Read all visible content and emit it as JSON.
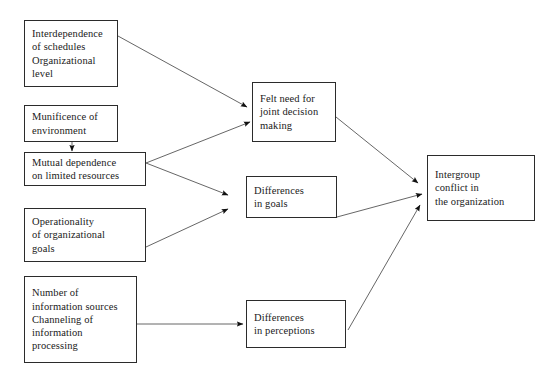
{
  "diagram": {
    "type": "flowchart",
    "canvas": {
      "width": 559,
      "height": 379
    },
    "style": {
      "background_color": "#ffffff",
      "box_border_color": "#2b2b2b",
      "box_fill_color": "#ffffff",
      "text_color": "#1a1a1a",
      "arrow_color": "#555555",
      "arrowhead_color": "#111111"
    },
    "nodes": [
      {
        "id": "interdependence",
        "name": "interdependence-of-schedules",
        "lines": [
          "Interdependence",
          "of schedules",
          "Organizational",
          "level"
        ],
        "x": 24,
        "y": 20,
        "w": 94,
        "h": 67,
        "column": "antecedent"
      },
      {
        "id": "munificence",
        "name": "munificence-of-environment",
        "lines": [
          "Munificence of",
          "environment"
        ],
        "x": 24,
        "y": 105,
        "w": 94,
        "h": 37,
        "column": "antecedent"
      },
      {
        "id": "mutual-dependence",
        "name": "mutual-dependence-on-limited-resources",
        "lines": [
          "Mutual dependence",
          "on limited resources"
        ],
        "x": 24,
        "y": 152,
        "w": 122,
        "h": 34,
        "column": "antecedent"
      },
      {
        "id": "operationality",
        "name": "operationality-of-organizational-goals",
        "lines": [
          "Operationality",
          "of organizational",
          "goals"
        ],
        "x": 24,
        "y": 208,
        "w": 122,
        "h": 54,
        "column": "antecedent"
      },
      {
        "id": "information",
        "name": "number-of-information-sources",
        "lines": [
          "Number of",
          "information sources",
          "Channeling of",
          "information",
          "processing"
        ],
        "x": 24,
        "y": 276,
        "w": 113,
        "h": 87,
        "column": "antecedent"
      },
      {
        "id": "felt-need",
        "name": "felt-need-for-joint-decision-making",
        "lines": [
          "Felt need for",
          "joint decision",
          "making"
        ],
        "x": 252,
        "y": 82,
        "w": 84,
        "h": 60,
        "column": "mediator"
      },
      {
        "id": "differences-goals",
        "name": "differences-in-goals",
        "lines": [
          "Differences",
          "in goals"
        ],
        "x": 246,
        "y": 176,
        "w": 91,
        "h": 42,
        "column": "mediator"
      },
      {
        "id": "differences-perceptions",
        "name": "differences-in-perceptions",
        "lines": [
          "Differences",
          "in perceptions"
        ],
        "x": 246,
        "y": 300,
        "w": 100,
        "h": 48,
        "column": "mediator"
      },
      {
        "id": "intergroup-conflict",
        "name": "intergroup-conflict-in-the-organization",
        "lines": [
          "Intergroup",
          "conflict in",
          "the organization"
        ],
        "x": 427,
        "y": 155,
        "w": 108,
        "h": 66,
        "column": "outcome"
      }
    ],
    "edges": [
      {
        "id": "e1",
        "name": "edge-interdependence-to-felt-need",
        "from": "interdependence",
        "to": "felt-need",
        "x1": 118,
        "y1": 36,
        "x2": 247,
        "y2": 107
      },
      {
        "id": "e2",
        "name": "edge-munificence-to-mutual-dependence",
        "from": "munificence",
        "to": "mutual-dependence",
        "x1": 72,
        "y1": 142,
        "x2": 72,
        "y2": 151
      },
      {
        "id": "e3",
        "name": "edge-mutual-dependence-to-felt-need",
        "from": "mutual-dependence",
        "to": "felt-need",
        "x1": 146,
        "y1": 163,
        "x2": 250,
        "y2": 122
      },
      {
        "id": "e4",
        "name": "edge-mutual-dependence-to-differences-goals",
        "from": "mutual-dependence",
        "to": "differences-goals",
        "x1": 146,
        "y1": 163,
        "x2": 228,
        "y2": 195
      },
      {
        "id": "e5",
        "name": "edge-operationality-to-differences-goals",
        "from": "operationality",
        "to": "differences-goals",
        "x1": 146,
        "y1": 247,
        "x2": 228,
        "y2": 209
      },
      {
        "id": "e6",
        "name": "edge-information-to-differences-perceptions",
        "from": "information",
        "to": "differences-perceptions",
        "x1": 137,
        "y1": 324,
        "x2": 243,
        "y2": 324
      },
      {
        "id": "e7",
        "name": "edge-felt-need-to-intergroup-conflict",
        "from": "felt-need",
        "to": "intergroup-conflict",
        "x1": 336,
        "y1": 117,
        "x2": 418,
        "y2": 183
      },
      {
        "id": "e8",
        "name": "edge-differences-goals-to-intergroup-conflict",
        "from": "differences-goals",
        "to": "intergroup-conflict",
        "x1": 337,
        "y1": 217,
        "x2": 422,
        "y2": 194
      },
      {
        "id": "e9",
        "name": "edge-differences-perceptions-to-intergroup-conflict",
        "from": "differences-perceptions",
        "to": "intergroup-conflict",
        "x1": 348,
        "y1": 330,
        "x2": 420,
        "y2": 205
      }
    ]
  }
}
